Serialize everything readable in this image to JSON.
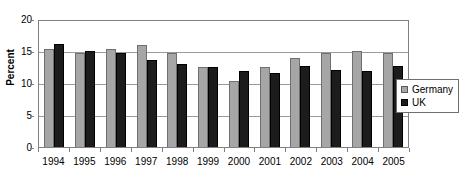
{
  "chart_data": {
    "type": "bar",
    "title": "",
    "xlabel": "",
    "ylabel": "Percent",
    "ylim": [
      0,
      20
    ],
    "yticks": [
      0,
      5,
      10,
      15,
      20
    ],
    "grid": true,
    "legend_position": "right",
    "categories": [
      "1994",
      "1995",
      "1996",
      "1997",
      "1998",
      "1999",
      "2000",
      "2001",
      "2002",
      "2003",
      "2004",
      "2005"
    ],
    "series": [
      {
        "name": "Germany",
        "color": "#a6a6a6",
        "values": [
          15.6,
          15.0,
          15.6,
          16.2,
          15.0,
          12.7,
          10.5,
          12.7,
          14.1,
          15.0,
          15.2,
          15.0
        ]
      },
      {
        "name": "UK",
        "color": "#1c1c1c",
        "values": [
          16.4,
          15.3,
          15.0,
          13.8,
          13.1,
          12.7,
          12.0,
          11.8,
          12.9,
          12.2,
          12.0,
          12.8
        ]
      }
    ]
  }
}
